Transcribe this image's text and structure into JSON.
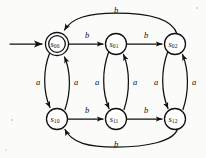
{
  "diagram": {
    "type": "finite-state-machine",
    "canvas": {
      "width": 206,
      "height": 158
    },
    "colors": {
      "stroke": "#111111",
      "background": "#fbfbf9",
      "node_fill": "#ffffff"
    },
    "states": [
      {
        "id": "s00",
        "base": "s",
        "sub": "00",
        "cx": 57,
        "cy": 44,
        "r": 11.5,
        "double": true,
        "initial": true
      },
      {
        "id": "s01",
        "base": "s",
        "sub": "01",
        "cx": 116,
        "cy": 44,
        "r": 10.5,
        "double": false,
        "initial": false
      },
      {
        "id": "s02",
        "base": "s",
        "sub": "02",
        "cx": 175,
        "cy": 44,
        "r": 10.5,
        "double": false,
        "initial": false
      },
      {
        "id": "s10",
        "base": "s",
        "sub": "10",
        "cx": 57,
        "cy": 119,
        "r": 10.5,
        "double": false,
        "initial": false
      },
      {
        "id": "s11",
        "base": "s",
        "sub": "11",
        "cx": 116,
        "cy": 119,
        "r": 10.5,
        "double": false,
        "initial": false
      },
      {
        "id": "s12",
        "base": "s",
        "sub": "12",
        "cx": 175,
        "cy": 119,
        "r": 10.5,
        "double": false,
        "initial": false
      }
    ],
    "start_arrow": {
      "from_x": 10,
      "to_x": 43,
      "y": 44
    },
    "transitions": [
      {
        "id": "t1",
        "from": "s00",
        "to": "s01",
        "symbol": "b",
        "label_x": 87,
        "label_y": 36,
        "kind": "straight-right"
      },
      {
        "id": "t2",
        "from": "s01",
        "to": "s02",
        "symbol": "b",
        "label_x": 146,
        "label_y": 36,
        "kind": "straight-right"
      },
      {
        "id": "t3",
        "from": "s02",
        "to": "s00",
        "symbol": "b",
        "label_x": 116,
        "label_y": 12,
        "kind": "arc-top"
      },
      {
        "id": "t4",
        "from": "s10",
        "to": "s11",
        "symbol": "b",
        "label_x": 87,
        "label_y": 112,
        "kind": "straight-right"
      },
      {
        "id": "t5",
        "from": "s11",
        "to": "s12",
        "symbol": "b",
        "label_x": 146,
        "label_y": 112,
        "kind": "straight-right"
      },
      {
        "id": "t6",
        "from": "s12",
        "to": "s10",
        "symbol": "b",
        "label_x": 116,
        "label_y": 146,
        "kind": "arc-bottom"
      },
      {
        "id": "t7",
        "from": "s00",
        "to": "s10",
        "symbol": "a",
        "label_x": 39,
        "label_y": 83,
        "kind": "curve-down-left"
      },
      {
        "id": "t8",
        "from": "s10",
        "to": "s00",
        "symbol": "a",
        "label_x": 75,
        "label_y": 83,
        "kind": "curve-up-right"
      },
      {
        "id": "t9",
        "from": "s01",
        "to": "s11",
        "symbol": "a",
        "label_x": 98,
        "label_y": 83,
        "kind": "curve-down-left"
      },
      {
        "id": "t10",
        "from": "s11",
        "to": "s01",
        "symbol": "a",
        "label_x": 134,
        "label_y": 83,
        "kind": "curve-up-right"
      },
      {
        "id": "t11",
        "from": "s02",
        "to": "s12",
        "symbol": "a",
        "label_x": 157,
        "label_y": 83,
        "kind": "curve-down-left"
      },
      {
        "id": "t12",
        "from": "s12",
        "to": "s02",
        "symbol": "a",
        "label_x": 193,
        "label_y": 83,
        "kind": "curve-up-right"
      }
    ],
    "alphabet": [
      "a",
      "b"
    ]
  }
}
